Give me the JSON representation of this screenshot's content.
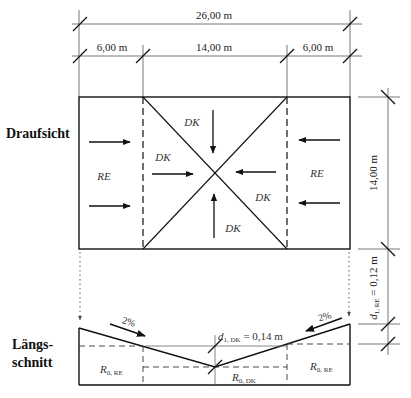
{
  "labels": {
    "plan_view": "Draufsicht",
    "section_line1": "Längs-",
    "section_line2": "schnitt"
  },
  "dimensions": {
    "total_width": "26,00 m",
    "left_strip": "6,00 m",
    "middle": "14,00 m",
    "right_strip": "6,00 m",
    "depth": "14,00 m",
    "d1_re_main": "d",
    "d1_re_sub": "1, RE",
    "d1_re_value": " = 0,12 m",
    "d1_dk_main": "d",
    "d1_dk_sub": "1, DK",
    "d1_dk_value": " = 0,14 m"
  },
  "zones": {
    "re_left": "RE",
    "re_right": "RE",
    "dk_top": "DK",
    "dk_left": "DK",
    "dk_right": "DK",
    "dk_bottom": "DK"
  },
  "section": {
    "slope_left": "2%",
    "slope_right": "2%",
    "r0_re_left_main": "R",
    "r0_re_left_sub": "0, RE",
    "r0_dk_main": "R",
    "r0_dk_sub": "0, DK",
    "r0_re_right_main": "R",
    "r0_re_right_sub": "0, RE"
  },
  "colors": {
    "line": "#1a1a1a",
    "dim": "#555555"
  }
}
